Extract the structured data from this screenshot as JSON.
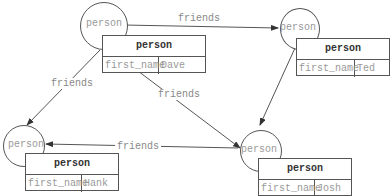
{
  "diagram": {
    "node_type": "person",
    "edge_label": "friends",
    "nodes": [
      {
        "id": "dave",
        "type": "person",
        "title": "person",
        "key": "first_name",
        "value": "Dave"
      },
      {
        "id": "ted",
        "type": "person",
        "title": "person",
        "key": "first_name",
        "value": "Ted"
      },
      {
        "id": "hank",
        "type": "person",
        "title": "person",
        "key": "first_name",
        "value": "Hank"
      },
      {
        "id": "josh",
        "type": "person",
        "title": "person",
        "key": "first_name",
        "value": "Josh"
      }
    ],
    "edges": [
      {
        "from": "dave",
        "to": "ted",
        "label": "friends"
      },
      {
        "from": "dave",
        "to": "hank",
        "label": "friends"
      },
      {
        "from": "dave",
        "to": "josh",
        "label": "friends"
      },
      {
        "from": "ted",
        "to": "josh",
        "label": "friends"
      },
      {
        "from": "josh",
        "to": "hank",
        "label": "friends"
      }
    ]
  }
}
